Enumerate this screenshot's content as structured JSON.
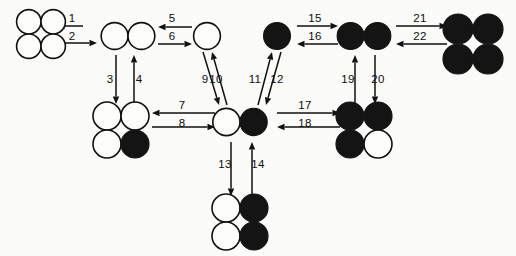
{
  "diagram": {
    "type": "state-transition-network",
    "canvas": {
      "width": 516,
      "height": 256,
      "background": "#fbfbfa"
    },
    "colors": {
      "open_fill": "#fdfdfc",
      "filled_fill": "#141414",
      "stroke": "#111111",
      "label": "#0d0d0d"
    },
    "legend": {
      "open_circle": "white-circle",
      "filled_circle": "black-circle"
    },
    "nodes": [
      {
        "id": "n1",
        "name": "cluster-4-white-square",
        "label": "4 white circles, 2x2",
        "cx": 41,
        "cy": 34,
        "r": 12.2,
        "layout": "square",
        "cells": [
          "open",
          "open",
          "open",
          "open"
        ]
      },
      {
        "id": "n2",
        "name": "cluster-2-white-pair",
        "label": "2 white circles, horizontal pair",
        "cx": 128,
        "cy": 36,
        "r": 13.4,
        "layout": "pair-h",
        "cells": [
          "open",
          "open"
        ]
      },
      {
        "id": "n3",
        "name": "cluster-1-white",
        "label": "1 white circle",
        "cx": 207,
        "cy": 36,
        "r": 13.4,
        "layout": "single",
        "cells": [
          "open"
        ]
      },
      {
        "id": "n4",
        "name": "cluster-1-black",
        "label": "1 black circle",
        "cx": 277,
        "cy": 36,
        "r": 13.4,
        "layout": "single",
        "cells": [
          "filled"
        ]
      },
      {
        "id": "n5",
        "name": "cluster-2-black-pair",
        "label": "2 black circles, horizontal pair",
        "cx": 364,
        "cy": 36,
        "r": 13.4,
        "layout": "pair-h",
        "cells": [
          "filled",
          "filled"
        ]
      },
      {
        "id": "n6",
        "name": "cluster-4-black-square",
        "label": "4 black circles, 2x2",
        "cx": 473,
        "cy": 44,
        "r": 15.0,
        "layout": "square",
        "cells": [
          "filled",
          "filled",
          "filled",
          "filled"
        ]
      },
      {
        "id": "n7",
        "name": "cluster-3-white-1-black-square",
        "label": "2x2 with 3 white and 1 black (bottom-right)",
        "cx": 121,
        "cy": 130,
        "r": 14.0,
        "layout": "square",
        "cells": [
          "open",
          "open",
          "open",
          "filled"
        ]
      },
      {
        "id": "n8",
        "name": "cluster-white-black-pair",
        "label": "1 white and 1 black horizontal pair",
        "cx": 240,
        "cy": 122,
        "r": 13.6,
        "layout": "pair-h",
        "cells": [
          "open",
          "filled"
        ]
      },
      {
        "id": "n9",
        "name": "cluster-3-black-1-white-square",
        "label": "2x2 with 3 black and 1 white (bottom-right)",
        "cx": 364,
        "cy": 130,
        "r": 14.0,
        "layout": "square",
        "cells": [
          "filled",
          "filled",
          "filled",
          "open"
        ]
      },
      {
        "id": "n10",
        "name": "cluster-2-white-2-black-square",
        "label": "2x2 with left column white and right column black",
        "cx": 240,
        "cy": 222,
        "r": 14.0,
        "layout": "square",
        "cells": [
          "open",
          "filled",
          "open",
          "filled"
        ]
      }
    ],
    "arrows": [
      {
        "id": "a1",
        "label": "1",
        "name": "arrow-1",
        "from": "n2",
        "to": "n1",
        "direction": "left",
        "x1": 83,
        "y1": 26,
        "x2": 57,
        "y2": 26
      },
      {
        "id": "a2",
        "label": "2",
        "name": "arrow-2",
        "from": "n1",
        "to": "n2",
        "direction": "right",
        "x1": 57,
        "y1": 43,
        "x2": 97,
        "y2": 43
      },
      {
        "id": "a3",
        "label": "3",
        "name": "arrow-3",
        "from": "n2",
        "to": "n7",
        "direction": "down",
        "x1": 116,
        "y1": 55,
        "x2": 116,
        "y2": 104
      },
      {
        "id": "a4",
        "label": "4",
        "name": "arrow-4",
        "from": "n7",
        "to": "n2",
        "direction": "up",
        "x1": 134,
        "y1": 104,
        "x2": 134,
        "y2": 55
      },
      {
        "id": "a5",
        "label": "5",
        "name": "arrow-5",
        "from": "n3",
        "to": "n2",
        "direction": "left",
        "x1": 192,
        "y1": 27,
        "x2": 158,
        "y2": 27
      },
      {
        "id": "a6",
        "label": "6",
        "name": "arrow-6",
        "from": "n2",
        "to": "n3",
        "direction": "right",
        "x1": 158,
        "y1": 44,
        "x2": 192,
        "y2": 44
      },
      {
        "id": "a7",
        "label": "7",
        "name": "arrow-7",
        "from": "n8",
        "to": "n7",
        "direction": "left",
        "x1": 215,
        "y1": 113,
        "x2": 152,
        "y2": 113
      },
      {
        "id": "a8",
        "label": "8",
        "name": "arrow-8",
        "from": "n7",
        "to": "n8",
        "direction": "right",
        "x1": 152,
        "y1": 127,
        "x2": 215,
        "y2": 127
      },
      {
        "id": "a9",
        "label": "9",
        "name": "arrow-9",
        "from": "n3",
        "to": "n8",
        "direction": "down-right",
        "x1": 203,
        "y1": 52,
        "x2": 219,
        "y2": 105
      },
      {
        "id": "a10",
        "label": "10",
        "name": "arrow-10",
        "from": "n8",
        "to": "n3",
        "direction": "up-left",
        "x1": 227,
        "y1": 105,
        "x2": 212,
        "y2": 52
      },
      {
        "id": "a11",
        "label": "11",
        "name": "arrow-11",
        "from": "n8",
        "to": "n4",
        "direction": "up-right",
        "x1": 258,
        "y1": 105,
        "x2": 272,
        "y2": 52
      },
      {
        "id": "a12",
        "label": "12",
        "name": "arrow-12",
        "from": "n4",
        "to": "n8",
        "direction": "down-left",
        "x1": 281,
        "y1": 52,
        "x2": 266,
        "y2": 105
      },
      {
        "id": "a13",
        "label": "13",
        "name": "arrow-13",
        "from": "n8",
        "to": "n10",
        "direction": "down",
        "x1": 231,
        "y1": 142,
        "x2": 231,
        "y2": 196
      },
      {
        "id": "a14",
        "label": "14",
        "name": "arrow-14",
        "from": "n10",
        "to": "n8",
        "direction": "up",
        "x1": 252,
        "y1": 196,
        "x2": 252,
        "y2": 142
      },
      {
        "id": "a15",
        "label": "15",
        "name": "arrow-15",
        "from": "n4",
        "to": "n5",
        "direction": "right",
        "x1": 297,
        "y1": 26,
        "x2": 338,
        "y2": 26
      },
      {
        "id": "a16",
        "label": "16",
        "name": "arrow-16",
        "from": "n5",
        "to": "n4",
        "direction": "left",
        "x1": 338,
        "y1": 44,
        "x2": 297,
        "y2": 44
      },
      {
        "id": "a17",
        "label": "17",
        "name": "arrow-17",
        "from": "n8",
        "to": "n9",
        "direction": "right",
        "x1": 277,
        "y1": 113,
        "x2": 340,
        "y2": 113
      },
      {
        "id": "a18",
        "label": "18",
        "name": "arrow-18",
        "from": "n9",
        "to": "n8",
        "direction": "left",
        "x1": 340,
        "y1": 127,
        "x2": 277,
        "y2": 127
      },
      {
        "id": "a19",
        "label": "19",
        "name": "arrow-19",
        "from": "n9",
        "to": "n5",
        "direction": "up",
        "x1": 355,
        "y1": 104,
        "x2": 355,
        "y2": 55
      },
      {
        "id": "a20",
        "label": "20",
        "name": "arrow-20",
        "from": "n5",
        "to": "n9",
        "direction": "down",
        "x1": 375,
        "y1": 55,
        "x2": 375,
        "y2": 104
      },
      {
        "id": "a21",
        "label": "21",
        "name": "arrow-21",
        "from": "n5",
        "to": "n6",
        "direction": "right",
        "x1": 396,
        "y1": 26,
        "x2": 447,
        "y2": 26
      },
      {
        "id": "a22",
        "label": "22",
        "name": "arrow-22",
        "from": "n6",
        "to": "n5",
        "direction": "left",
        "x1": 447,
        "y1": 44,
        "x2": 396,
        "y2": 44
      }
    ],
    "arrow_labels": [
      {
        "label": "1",
        "x": 72,
        "y": 22
      },
      {
        "label": "2",
        "x": 72,
        "y": 40
      },
      {
        "label": "3",
        "x": 110,
        "y": 83
      },
      {
        "label": "4",
        "x": 139,
        "y": 83
      },
      {
        "label": "5",
        "x": 172,
        "y": 22
      },
      {
        "label": "6",
        "x": 172,
        "y": 40
      },
      {
        "label": "7",
        "x": 182,
        "y": 109
      },
      {
        "label": "8",
        "x": 182,
        "y": 127
      },
      {
        "label": "9",
        "x": 205,
        "y": 83
      },
      {
        "label": "10",
        "x": 216,
        "y": 83
      },
      {
        "label": "11",
        "x": 255,
        "y": 83
      },
      {
        "label": "12",
        "x": 277,
        "y": 83
      },
      {
        "label": "13",
        "x": 225,
        "y": 168
      },
      {
        "label": "14",
        "x": 258,
        "y": 168
      },
      {
        "label": "15",
        "x": 315,
        "y": 22
      },
      {
        "label": "16",
        "x": 315,
        "y": 40
      },
      {
        "label": "17",
        "x": 305,
        "y": 109
      },
      {
        "label": "18",
        "x": 305,
        "y": 127
      },
      {
        "label": "19",
        "x": 348,
        "y": 83
      },
      {
        "label": "20",
        "x": 378,
        "y": 83
      },
      {
        "label": "21",
        "x": 420,
        "y": 22
      },
      {
        "label": "22",
        "x": 420,
        "y": 40
      }
    ]
  }
}
